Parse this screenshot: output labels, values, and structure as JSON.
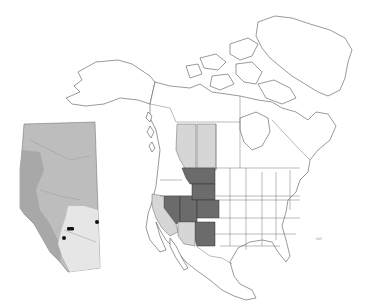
{
  "map": {
    "type": "species-range-map",
    "region": "North America",
    "legend_colors": {
      "core_range": "#6b6b6b",
      "peripheral_range": "#d6d6d6",
      "land": "#ffffff",
      "inset_base": "#bdbdbd",
      "occurrence_dot": "#111111"
    },
    "core_range_regions": [
      "Montana",
      "Wyoming",
      "Nevada",
      "Utah",
      "Colorado",
      "New Mexico"
    ],
    "peripheral_range_regions": [
      "Alberta",
      "Saskatchewan",
      "California",
      "Arizona"
    ],
    "inset": {
      "region": "Alberta",
      "occurrence_points": [
        {
          "x": 70,
          "y": 228,
          "shape": "bar"
        },
        {
          "x": 63,
          "y": 238,
          "shape": "dot"
        },
        {
          "x": 97,
          "y": 222,
          "shape": "dot"
        }
      ]
    },
    "scale_label": "EOT"
  }
}
